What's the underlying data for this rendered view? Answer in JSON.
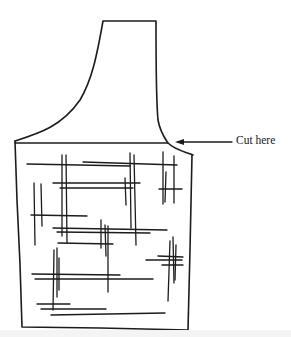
{
  "figure": {
    "annotation": {
      "label": "Cut here",
      "arrow_direction": "left"
    },
    "colors": {
      "ink": "#1c1c1c",
      "background": "#ffffff"
    }
  }
}
